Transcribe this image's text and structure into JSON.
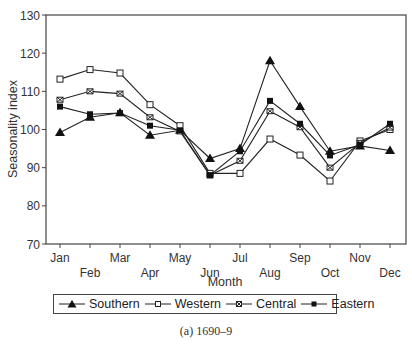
{
  "chart_data": {
    "type": "line",
    "title": "",
    "caption": "(a) 1690–9",
    "xlabel": "Month",
    "ylabel": "Seasonality index",
    "ylim": [
      70,
      130
    ],
    "yticks": [
      70,
      80,
      90,
      100,
      110,
      120,
      130
    ],
    "grid": false,
    "legend_position": "bottom",
    "categories": [
      "Jan",
      "Feb",
      "Mar",
      "Apr",
      "May",
      "Jun",
      "Jul",
      "Aug",
      "Sep",
      "Oct",
      "Nov",
      "Dec"
    ],
    "series": [
      {
        "name": "Southern",
        "marker": "filled-triangle",
        "values": [
          99.2,
          103.2,
          104.4,
          98.5,
          99.8,
          92.4,
          95.0,
          118.0,
          106.0,
          94.3,
          95.7,
          94.5
        ]
      },
      {
        "name": "Western",
        "marker": "open-square",
        "values": [
          113.2,
          115.7,
          114.8,
          106.5,
          101.0,
          88.5,
          88.5,
          97.5,
          93.3,
          86.5,
          97.0,
          100.0
        ]
      },
      {
        "name": "Central",
        "marker": "cross-square",
        "values": [
          107.8,
          110.0,
          109.4,
          103.2,
          99.5,
          88.0,
          91.8,
          104.8,
          100.6,
          90.0,
          96.5,
          100.5
        ]
      },
      {
        "name": "Eastern",
        "marker": "filled-square",
        "values": [
          106.0,
          104.0,
          104.3,
          101.0,
          99.8,
          88.0,
          94.3,
          107.5,
          101.5,
          93.2,
          96.0,
          101.5
        ]
      }
    ]
  },
  "legend": {
    "items": [
      {
        "label": "Southern"
      },
      {
        "label": "Western"
      },
      {
        "label": "Central"
      },
      {
        "label": "Eastern"
      }
    ]
  },
  "caption": "(a) 1690–9"
}
